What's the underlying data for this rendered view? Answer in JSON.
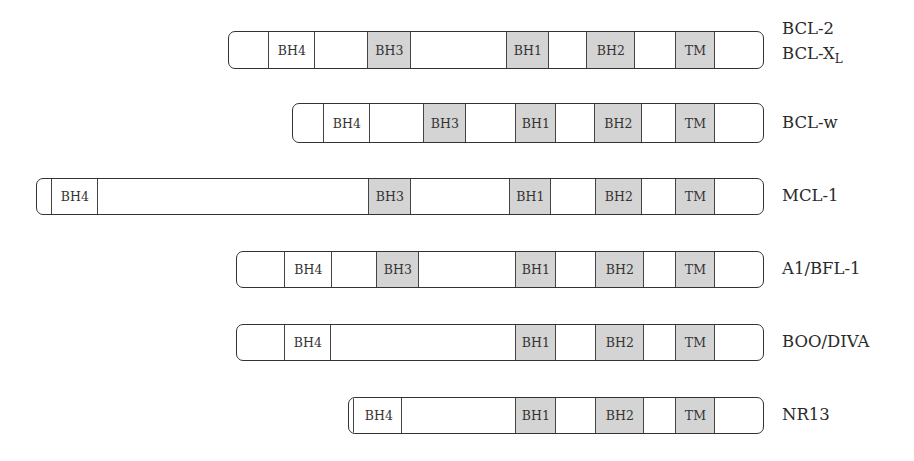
{
  "figure": {
    "colors": {
      "shaded_domain": "#d4d4d4",
      "unshaded_domain": "#ffffff",
      "outline": "#333333"
    },
    "proteins": [
      {
        "id": "bcl2",
        "labels": [
          "BCL-2"
        ],
        "label2_main": "BCL-X",
        "label2_sub": "L",
        "box": {
          "left": 228,
          "top": 31,
          "right": 764,
          "bottom": 69
        },
        "domains": [
          {
            "name": "BH4",
            "x1": 269,
            "x2": 316,
            "shaded": false
          },
          {
            "name": "BH3",
            "x1": 368,
            "x2": 412,
            "shaded": true
          },
          {
            "name": "BH1",
            "x1": 507,
            "x2": 550,
            "shaded": true
          },
          {
            "name": "BH2",
            "x1": 587,
            "x2": 636,
            "shaded": true
          },
          {
            "name": "TM",
            "x1": 676,
            "x2": 716,
            "shaded": true
          }
        ],
        "label_pos": {
          "x": 782,
          "y": 20
        }
      },
      {
        "id": "bclw",
        "labels": [
          "BCL-w"
        ],
        "box": {
          "left": 292,
          "top": 103,
          "right": 764,
          "bottom": 143
        },
        "domains": [
          {
            "name": "BH4",
            "x1": 324,
            "x2": 371,
            "shaded": false
          },
          {
            "name": "BH3",
            "x1": 424,
            "x2": 467,
            "shaded": true
          },
          {
            "name": "BH1",
            "x1": 516,
            "x2": 557,
            "shaded": true
          },
          {
            "name": "BH2",
            "x1": 595,
            "x2": 643,
            "shaded": true
          },
          {
            "name": "TM",
            "x1": 676,
            "x2": 716,
            "shaded": true
          }
        ],
        "label_pos": {
          "x": 782,
          "y": 113
        }
      },
      {
        "id": "mcl1",
        "labels": [
          "MCL-1"
        ],
        "box": {
          "left": 36,
          "top": 178,
          "right": 764,
          "bottom": 215
        },
        "domains": [
          {
            "name": "BH4",
            "x1": 52,
            "x2": 99,
            "shaded": false
          },
          {
            "name": "BH3",
            "x1": 369,
            "x2": 412,
            "shaded": true
          },
          {
            "name": "BH1",
            "x1": 510,
            "x2": 552,
            "shaded": true
          },
          {
            "name": "BH2",
            "x1": 596,
            "x2": 643,
            "shaded": true
          },
          {
            "name": "TM",
            "x1": 676,
            "x2": 716,
            "shaded": true
          }
        ],
        "label_pos": {
          "x": 782,
          "y": 186
        }
      },
      {
        "id": "a1",
        "labels": [
          "A1/BFL-1"
        ],
        "box": {
          "left": 236,
          "top": 251,
          "right": 764,
          "bottom": 288
        },
        "domains": [
          {
            "name": "BH4",
            "x1": 285,
            "x2": 333,
            "shaded": false
          },
          {
            "name": "BH3",
            "x1": 377,
            "x2": 420,
            "shaded": true
          },
          {
            "name": "BH1",
            "x1": 516,
            "x2": 557,
            "shaded": true
          },
          {
            "name": "BH2",
            "x1": 596,
            "x2": 645,
            "shaded": true
          },
          {
            "name": "TM",
            "x1": 676,
            "x2": 716,
            "shaded": true
          }
        ],
        "label_pos": {
          "x": 782,
          "y": 259
        }
      },
      {
        "id": "boo",
        "labels": [
          "BOO/DIVA"
        ],
        "box": {
          "left": 236,
          "top": 324,
          "right": 764,
          "bottom": 361
        },
        "domains": [
          {
            "name": "BH4",
            "x1": 285,
            "x2": 332,
            "shaded": false
          },
          {
            "name": "BH1",
            "x1": 516,
            "x2": 557,
            "shaded": true
          },
          {
            "name": "BH2",
            "x1": 596,
            "x2": 645,
            "shaded": true
          },
          {
            "name": "TM",
            "x1": 676,
            "x2": 716,
            "shaded": true
          }
        ],
        "label_pos": {
          "x": 782,
          "y": 332
        }
      },
      {
        "id": "nr13",
        "labels": [
          "NR13"
        ],
        "box": {
          "left": 348,
          "top": 397,
          "right": 764,
          "bottom": 434
        },
        "domains": [
          {
            "name": "BH4",
            "x1": 356,
            "x2": 403,
            "shaded": false
          },
          {
            "name": "BH1",
            "x1": 516,
            "x2": 557,
            "shaded": true
          },
          {
            "name": "BH2",
            "x1": 596,
            "x2": 645,
            "shaded": true
          },
          {
            "name": "TM",
            "x1": 676,
            "x2": 716,
            "shaded": true
          }
        ],
        "label_pos": {
          "x": 782,
          "y": 405
        }
      }
    ]
  }
}
